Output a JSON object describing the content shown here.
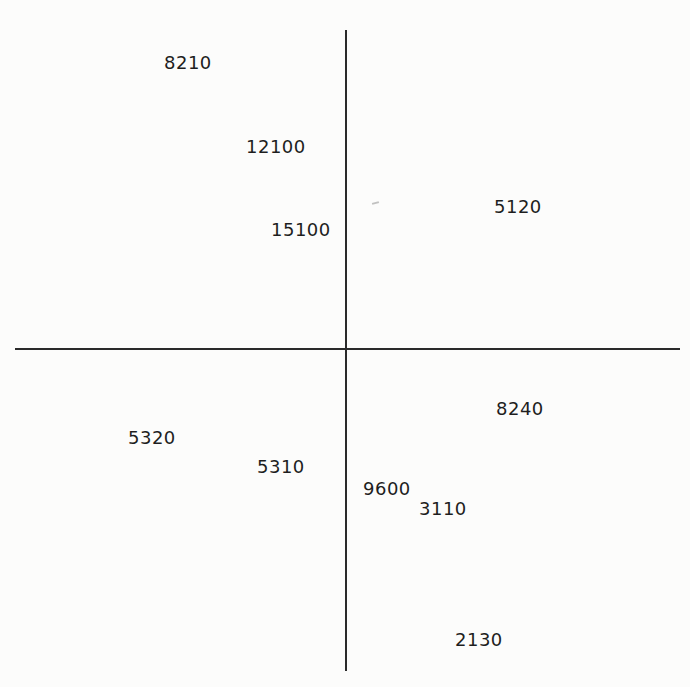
{
  "diagram": {
    "type": "quadrant-scatter-labels",
    "axes": {
      "vertical": {
        "x": 346,
        "y_start": 30,
        "y_end": 671
      },
      "horizontal": {
        "y": 349,
        "x_start": 15,
        "x_end": 680
      }
    },
    "labels": [
      {
        "id": "l0",
        "text": "8210",
        "quadrant": "upper-left",
        "x": 164,
        "y": 53
      },
      {
        "id": "l1",
        "text": "12100",
        "quadrant": "upper-left",
        "x": 246,
        "y": 137
      },
      {
        "id": "l2",
        "text": "15100",
        "quadrant": "upper-left",
        "x": 271,
        "y": 220
      },
      {
        "id": "l3",
        "text": "5120",
        "quadrant": "upper-right",
        "x": 494,
        "y": 197
      },
      {
        "id": "l4",
        "text": "8240",
        "quadrant": "lower-right",
        "x": 496,
        "y": 399
      },
      {
        "id": "l5",
        "text": "5320",
        "quadrant": "lower-left",
        "x": 128,
        "y": 428
      },
      {
        "id": "l6",
        "text": "5310",
        "quadrant": "lower-left",
        "x": 257,
        "y": 457
      },
      {
        "id": "l7",
        "text": "9600",
        "quadrant": "lower-right",
        "x": 363,
        "y": 479
      },
      {
        "id": "l8",
        "text": "3110",
        "quadrant": "lower-right",
        "x": 419,
        "y": 499
      },
      {
        "id": "l9",
        "text": "2130",
        "quadrant": "lower-right",
        "x": 455,
        "y": 630
      }
    ]
  },
  "colors": {
    "background": "#fcfcfb",
    "axis": "#2a2a2a",
    "text": "#1e1e1e"
  }
}
